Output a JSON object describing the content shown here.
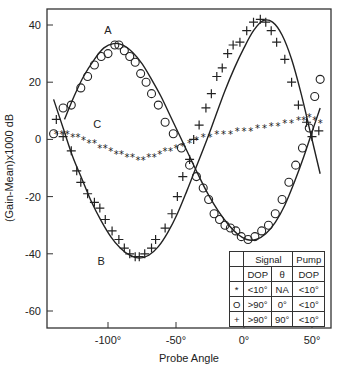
{
  "chart_data": {
    "type": "scatter",
    "title": "",
    "xlabel": "Probe Angle",
    "ylabel": "(Gain-Mean)x1000 dB",
    "xlim": [
      -145,
      64
    ],
    "ylim": [
      -67,
      46
    ],
    "xticks": [
      -100,
      -50,
      0,
      50
    ],
    "xtick_labels": [
      "-100°",
      "-50°",
      "0°",
      "50°"
    ],
    "yticks": [
      40,
      20,
      0,
      -20,
      -40,
      -60
    ],
    "ytick_labels": [
      "40",
      "20",
      "0",
      "-20",
      "-40",
      "-60"
    ],
    "grid": false,
    "annotations": [
      {
        "text": "A",
        "x": -100,
        "y": 37
      },
      {
        "text": "B",
        "x": -105,
        "y": -44
      },
      {
        "text": "C",
        "x": -108,
        "y": 4
      }
    ],
    "series": [
      {
        "name": "A (O: Signal DOP >90°, θ 0°, Pump DOP <10°)",
        "marker": "circle",
        "x": [
          -140,
          -133,
          -127,
          -120,
          -115,
          -110,
          -105,
          -100,
          -95,
          -92,
          -88,
          -84,
          -80,
          -76,
          -72,
          -68,
          -63,
          -58,
          -52,
          -46,
          -40,
          -35,
          -30,
          -26,
          -22,
          -18,
          -14,
          -10,
          -6,
          -2,
          3,
          8,
          13,
          18,
          23,
          28,
          33,
          38,
          43,
          48,
          52,
          56
        ],
        "y": [
          2,
          11,
          12,
          18,
          22,
          26,
          29,
          30,
          33,
          33,
          31,
          29,
          27,
          23,
          20,
          16,
          12,
          6,
          2,
          -3,
          -9,
          -13,
          -17,
          -21,
          -26,
          -28,
          -30,
          -31,
          -32,
          -34,
          -35,
          -34,
          -32,
          -30,
          -26,
          -21,
          -15,
          -9,
          -3,
          4,
          15,
          21
        ]
      },
      {
        "name": "B (+: Signal DOP >90°, θ 90°, Pump DOP <10°)",
        "marker": "plus",
        "x": [
          -138,
          -133,
          -127,
          -123,
          -120,
          -115,
          -110,
          -106,
          -102,
          -97,
          -92,
          -88,
          -84,
          -80,
          -77,
          -73,
          -68,
          -65,
          -58,
          -53,
          -49,
          -45,
          -40,
          -37,
          -33,
          -28,
          -24,
          -20,
          -16,
          -12,
          -8,
          -3,
          2,
          7,
          12,
          16,
          20,
          24,
          30,
          35,
          40,
          46,
          50,
          55
        ],
        "y": [
          7,
          1,
          -4,
          -11,
          -15,
          -19,
          -22,
          -24,
          -28,
          -32,
          -35,
          -38,
          -40,
          -41,
          -41,
          -40,
          -38,
          -35,
          -31,
          -26,
          -20,
          -13,
          -7,
          0,
          5,
          11,
          16,
          22,
          25,
          30,
          33,
          34,
          38,
          41,
          42,
          41,
          38,
          34,
          28,
          20,
          12,
          6,
          1,
          3
        ]
      },
      {
        "name": "C (*: Signal DOP <10°, θ NA, Pump DOP <10°)",
        "marker": "star",
        "x": [
          -138,
          -134,
          -130,
          -126,
          -122,
          -118,
          -114,
          -110,
          -106,
          -102,
          -98,
          -94,
          -90,
          -86,
          -82,
          -78,
          -74,
          -70,
          -66,
          -62,
          -58,
          -54,
          -50,
          -45,
          -40,
          -35,
          -30,
          -25,
          -20,
          -15,
          -10,
          -5,
          0,
          5,
          10,
          15,
          20,
          25,
          30,
          35,
          40,
          44,
          48,
          52,
          56
        ],
        "y": [
          2,
          2,
          2,
          1,
          1,
          0,
          -1,
          -1,
          -3,
          -3,
          -4,
          -5,
          -5,
          -6,
          -6,
          -7,
          -7,
          -6,
          -6,
          -5,
          -4,
          -4,
          -3,
          -2,
          -1,
          0,
          1,
          1,
          2,
          2,
          2,
          3,
          3,
          3,
          4,
          4,
          5,
          5,
          6,
          6,
          7,
          7,
          8,
          7,
          6
        ]
      },
      {
        "name": "Fit A",
        "marker": "line",
        "x": [
          -132,
          -125,
          -118,
          -110,
          -103,
          -96,
          -89,
          -82,
          -75,
          -68,
          -61,
          -54,
          -47,
          -40,
          -33,
          -26,
          -19,
          -12,
          -5,
          2,
          9,
          16,
          23,
          30,
          37,
          44,
          51,
          56
        ],
        "y": [
          7,
          15,
          22,
          28,
          32,
          33.5,
          33,
          30.5,
          26.5,
          21,
          15,
          8,
          1,
          -6,
          -13,
          -19.5,
          -25,
          -29.5,
          -33,
          -35,
          -35,
          -33,
          -29,
          -23,
          -15,
          -6,
          4,
          11
        ]
      },
      {
        "name": "Fit B",
        "marker": "line",
        "x": [
          -140,
          -133,
          -126,
          -119,
          -112,
          -105,
          -98,
          -91,
          -84,
          -77,
          -70,
          -63,
          -56,
          -49,
          -42,
          -35,
          -28,
          -21,
          -14,
          -7,
          0,
          7,
          14,
          21,
          28,
          35,
          42,
          49,
          56
        ],
        "y": [
          14,
          4,
          -6,
          -14,
          -22,
          -28.5,
          -34,
          -38,
          -40.5,
          -41.5,
          -40.5,
          -37.5,
          -32.5,
          -26,
          -18,
          -9.5,
          -1,
          8,
          17,
          25,
          32,
          38,
          41.5,
          41,
          36.5,
          28,
          16,
          2,
          -12
        ]
      }
    ],
    "legend": {
      "header": [
        "",
        "Signal",
        "Pump"
      ],
      "subheader": [
        "",
        "DOP",
        "θ",
        "DOP"
      ],
      "rows": [
        {
          "symbol": "*",
          "signal_dop": "<10°",
          "theta": "NA",
          "pump_dop": "<10°"
        },
        {
          "symbol": "O",
          "signal_dop": ">90°",
          "theta": "0°",
          "pump_dop": "<10°"
        },
        {
          "symbol": "+",
          "signal_dop": ">90°",
          "theta": "90°",
          "pump_dop": "<10°"
        }
      ],
      "position": "lower right"
    }
  }
}
